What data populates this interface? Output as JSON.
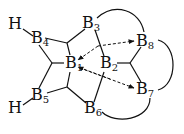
{
  "diagram": {
    "type": "borane-bonding-topology",
    "atoms": [
      {
        "id": "H_top",
        "label": "H",
        "sub": "",
        "x": 8,
        "y": 16
      },
      {
        "id": "B4",
        "label": "B",
        "sub": "4",
        "x": 31,
        "y": 30
      },
      {
        "id": "B3",
        "label": "B",
        "sub": "3",
        "x": 82,
        "y": 15
      },
      {
        "id": "B8",
        "label": "B",
        "sub": "8",
        "x": 136,
        "y": 33
      },
      {
        "id": "B1",
        "label": "B",
        "sub": "1",
        "x": 65,
        "y": 55
      },
      {
        "id": "B2",
        "label": "B",
        "sub": "2",
        "x": 100,
        "y": 55
      },
      {
        "id": "B7",
        "label": "B",
        "sub": "7",
        "x": 136,
        "y": 81
      },
      {
        "id": "H_bot",
        "label": "H",
        "sub": "",
        "x": 8,
        "y": 100
      },
      {
        "id": "B5",
        "label": "B",
        "sub": "5",
        "x": 31,
        "y": 87
      },
      {
        "id": "B6",
        "label": "B",
        "sub": "6",
        "x": 84,
        "y": 100
      }
    ],
    "colors": {
      "ink": "#111111",
      "background": "#ffffff"
    }
  }
}
